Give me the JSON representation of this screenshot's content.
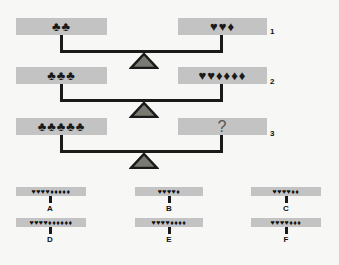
{
  "puzzle": {
    "rows": [
      {
        "number": "1",
        "left": "♣♣",
        "right": "♥♥♦"
      },
      {
        "number": "2",
        "left": "♣♣♣",
        "right": "♥♥♦♦♦♦"
      },
      {
        "number": "3",
        "left": "♣♣♣♣♣",
        "right": "?"
      }
    ],
    "options": [
      {
        "label": "A",
        "symbols": "♥♥♥♥♦♦♦♦♦"
      },
      {
        "label": "B",
        "symbols": "♥♥♥♥♦"
      },
      {
        "label": "C",
        "symbols": "♥♥♥♥♦♦"
      },
      {
        "label": "D",
        "symbols": "♥♥♥♥♦♦♦♦♦♦"
      },
      {
        "label": "E",
        "symbols": "♥♥♥♥♦♦♦♦"
      },
      {
        "label": "F",
        "symbols": "♥♥♥♥♦♦♦"
      }
    ],
    "colors": {
      "pan": "#c3c3c3",
      "beam": "#1a1a1a",
      "fulcrum_fill": "#7a7a72",
      "fulcrum_stroke": "#1a1a1a"
    }
  }
}
